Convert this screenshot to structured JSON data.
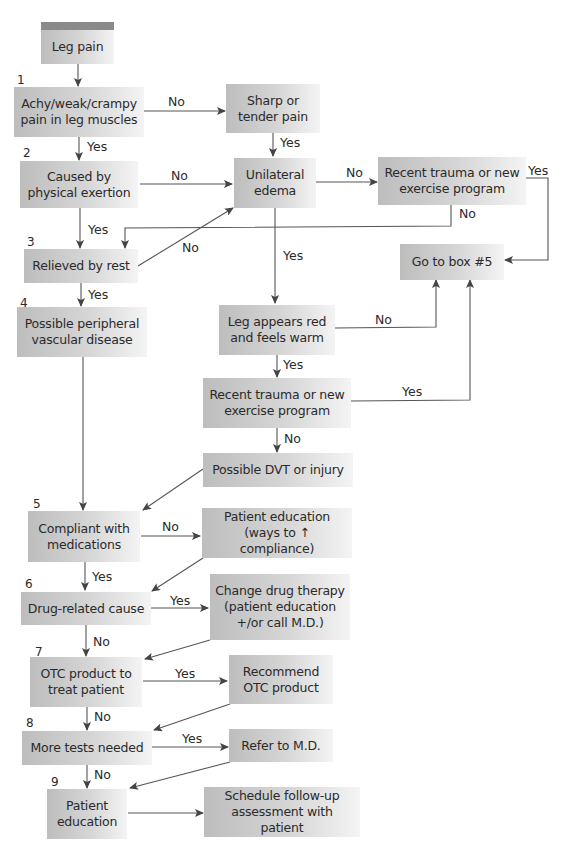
{
  "flowchart": {
    "start": "Leg pain",
    "steps": {
      "n1": "1",
      "n2": "2",
      "n3": "3",
      "n4": "4",
      "n5": "5",
      "n6": "6",
      "n7": "7",
      "n8": "8",
      "n9": "9"
    },
    "boxes": {
      "leg_pain": "Leg pain",
      "achy": "Achy/weak/crampy pain in leg muscles",
      "sharp": "Sharp or tender pain",
      "exertion": "Caused by physical exertion",
      "unilateral": "Unilateral edema",
      "recent_trauma_top": "Recent trauma or new exercise program",
      "relieved": "Relieved by rest",
      "goto5": "Go to box #5",
      "pvd": "Possible peripheral vascular disease",
      "red_warm": "Leg appears red and feels warm",
      "recent_trauma_mid": "Recent trauma or new exercise program",
      "dvt": "Possible DVT or injury",
      "compliant": "Compliant with medications",
      "patient_ed_compliance": "Patient education (ways to ↑ compliance)",
      "drug_related": "Drug-related cause",
      "change_drug": "Change drug therapy (patient education +/or call M.D.)",
      "otc": "OTC product to treat patient",
      "recommend_otc": "Recommend OTC product",
      "more_tests": "More tests needed",
      "refer_md": "Refer to M.D.",
      "patient_ed": "Patient education",
      "follow_up": "Schedule follow-up assessment with patient"
    },
    "edge_labels": {
      "achy_no": "No",
      "achy_yes": "Yes",
      "sharp_yes": "Yes",
      "exertion_no": "No",
      "exertion_yes": "Yes",
      "unilateral_no": "No",
      "unilateral_yes": "Yes",
      "trauma_top_yes": "Yes",
      "trauma_top_no": "No",
      "relieved_no": "No",
      "relieved_yes": "Yes",
      "red_no": "No",
      "red_yes": "Yes",
      "trauma_mid_yes": "Yes",
      "trauma_mid_no": "No",
      "compliant_no": "No",
      "compliant_yes": "Yes",
      "drug_yes": "Yes",
      "drug_no": "No",
      "otc_yes": "Yes",
      "otc_no": "No",
      "tests_yes": "Yes",
      "tests_no": "No"
    },
    "colors": {
      "box_dark": "#bdbdbd",
      "box_light": "#f4f4f4",
      "header_bar": "#8a8a8a",
      "line": "#444444"
    }
  }
}
